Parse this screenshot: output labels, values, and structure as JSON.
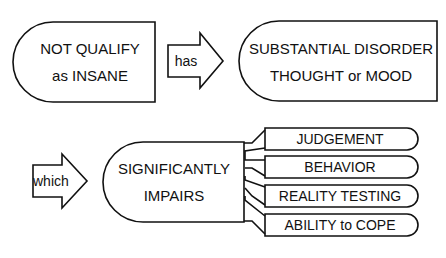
{
  "diagram": {
    "box_not_qualify": {
      "line1": "NOT QUALIFY",
      "line2": "as INSANE"
    },
    "arrow_has": {
      "label": "has"
    },
    "box_disorder": {
      "line1": "SUBSTANTIAL DISORDER",
      "line2": "THOUGHT or MOOD"
    },
    "arrow_which": {
      "label": "which"
    },
    "box_impairs": {
      "line1": "SIGNIFICANTLY",
      "line2": "IMPAIRS"
    },
    "impaired_items": [
      {
        "label": "JUDGEMENT"
      },
      {
        "label": "BEHAVIOR"
      },
      {
        "label": "REALITY TESTING"
      },
      {
        "label": "ABILITY to COPE"
      }
    ],
    "colors": {
      "stroke": "#111111",
      "background": "#ffffff"
    }
  }
}
